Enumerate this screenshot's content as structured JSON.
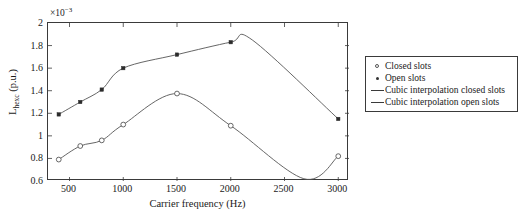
{
  "chart_data": {
    "type": "line",
    "title": "",
    "xlabel": "Carrier frequency (Hz)",
    "ylabel": "L_hexc (p.u.)",
    "ylabel_base": "L",
    "ylabel_sub": "hexc",
    "ylabel_unit": " (p.u.)",
    "exponent_label": "×10",
    "exponent_power": "−3",
    "xlim": [
      300,
      3100
    ],
    "ylim": [
      0.6,
      2.0
    ],
    "xticks": [
      500,
      1000,
      1500,
      2000,
      2500,
      3000
    ],
    "xtick_labels": [
      "500",
      "1000",
      "1500",
      "2000",
      "2500",
      "3000"
    ],
    "yticks": [
      0.6,
      0.8,
      1.0,
      1.2,
      1.4,
      1.6,
      1.8,
      2.0
    ],
    "ytick_labels": [
      "0.6",
      "0.8",
      "1",
      "1.2",
      "1.4",
      "1.6",
      "1.8",
      "2"
    ],
    "grid": false,
    "legend_position": "right-outside",
    "series": [
      {
        "name": "Open slots",
        "marker": "filled-dot",
        "x": [
          400,
          600,
          800,
          1000,
          1500,
          2000,
          3000
        ],
        "values": [
          1.19,
          1.3,
          1.41,
          1.6,
          1.72,
          1.83,
          1.15
        ],
        "interpolation": "cubic",
        "peak_x": 2200,
        "peak_y": 1.85,
        "color": "#555555"
      },
      {
        "name": "Closed slots",
        "marker": "open-circle",
        "x": [
          400,
          600,
          800,
          1000,
          1500,
          2000,
          3000
        ],
        "values": [
          0.79,
          0.91,
          0.96,
          1.1,
          1.375,
          1.09,
          0.82
        ],
        "interpolation": "cubic",
        "min_x": 2680,
        "min_y": 0.62,
        "color": "#555555"
      }
    ],
    "legend_entries": [
      {
        "label": "Closed slots",
        "key": "open-circle-marker"
      },
      {
        "label": "Open slots",
        "key": "filled-dot-marker"
      },
      {
        "label": "Cubic interpolation closed slots",
        "key": "line"
      },
      {
        "label": "Cubic interpolation open slots",
        "key": "line"
      }
    ]
  }
}
